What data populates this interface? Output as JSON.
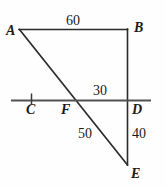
{
  "figure": {
    "type": "geometry-diagram",
    "stroke_color": "#2b2b2b",
    "background_color": "#fefefe",
    "text_color": "#1a1a1a"
  },
  "points": [
    {
      "id": "A",
      "label": "A",
      "x": 19,
      "y": 29,
      "label_x": 6,
      "label_y": 24
    },
    {
      "id": "B",
      "label": "B",
      "x": 127,
      "y": 29,
      "label_x": 134,
      "label_y": 21
    },
    {
      "id": "C",
      "label": "C",
      "x": 31,
      "y": 100,
      "label_x": 26,
      "label_y": 103
    },
    {
      "id": "D",
      "label": "D",
      "x": 127,
      "y": 100,
      "label_x": 132,
      "label_y": 103
    },
    {
      "id": "E",
      "label": "E",
      "x": 127,
      "y": 165,
      "label_x": 131,
      "label_y": 167
    },
    {
      "id": "F",
      "label": "F",
      "x": 72,
      "y": 100,
      "label_x": 61,
      "label_y": 103
    }
  ],
  "segments": [
    {
      "id": "AB",
      "from": "A",
      "to": "B"
    },
    {
      "id": "BE",
      "from": "B",
      "to": "E"
    },
    {
      "id": "AE",
      "from": "A",
      "to": "E"
    },
    {
      "id": "CD",
      "from": "C-line-left",
      "to": "D-line-right"
    }
  ],
  "measure_labels": [
    {
      "id": "AB-length",
      "value": "60",
      "x": 66,
      "y": 14
    },
    {
      "id": "FD-length",
      "value": "30",
      "x": 93,
      "y": 84
    },
    {
      "id": "FE-length",
      "value": "50",
      "x": 78,
      "y": 127
    },
    {
      "id": "DE-length",
      "value": "40",
      "x": 132,
      "y": 127
    }
  ],
  "tick_marks": [
    {
      "id": "tick-at-C",
      "x": 31,
      "y_top": 94,
      "y_bottom": 104
    }
  ],
  "transversal_line": {
    "x_start": 11,
    "x_end": 151,
    "y": 100
  }
}
